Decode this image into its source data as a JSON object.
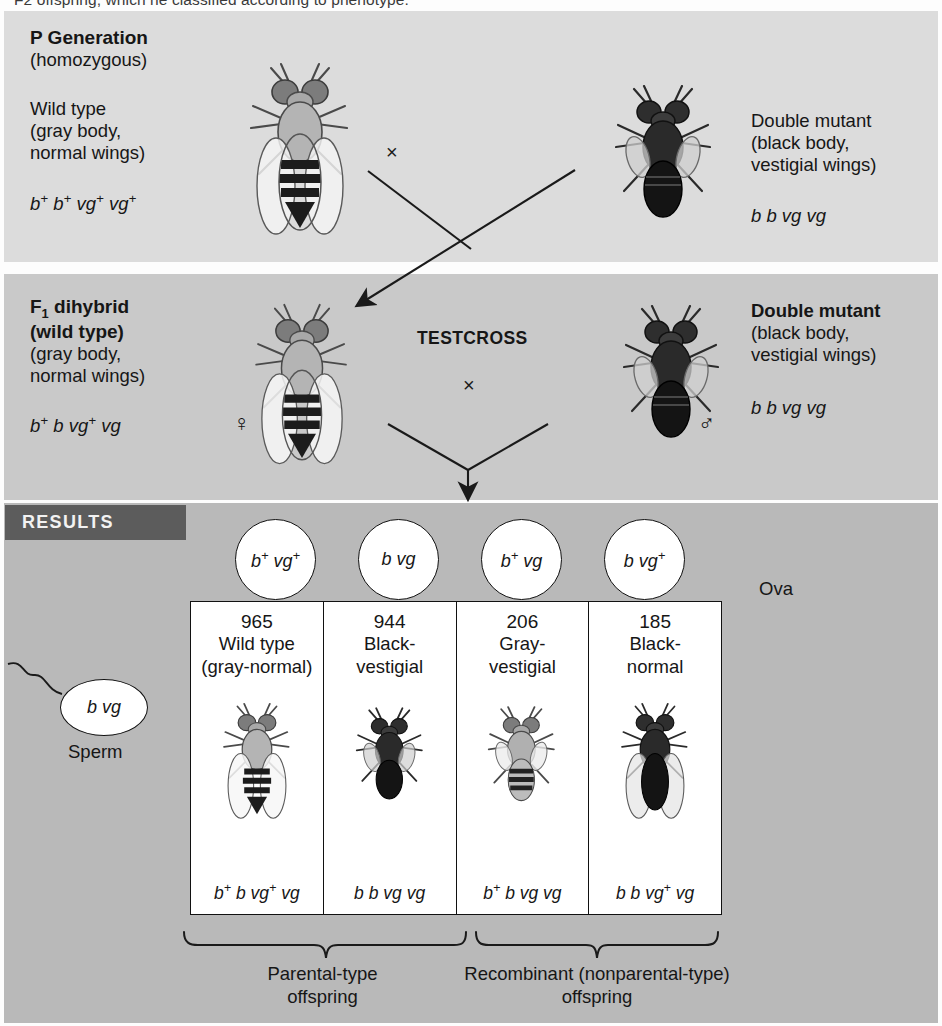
{
  "caption": {
    "top_cutoff_line": "F2 offspring, which he classified according to phenotype."
  },
  "p_generation": {
    "title": "P Generation",
    "subtitle": "(homozygous)",
    "left": {
      "name": "Wild type",
      "desc_line1": "(gray body,",
      "desc_line2": "normal wings)",
      "genotype": "b+ b+ vg+ vg+",
      "fly_icon": "fly-gray-normal-wings"
    },
    "right": {
      "name": "Double mutant",
      "desc_line1": "(black body,",
      "desc_line2": "vestigial wings)",
      "genotype": "b b vg vg",
      "fly_icon": "fly-black-vestigial-wings"
    },
    "cross_symbol": "×"
  },
  "f1_generation": {
    "left": {
      "title_line1": "F1 dihybrid",
      "title_line2": "(wild type)",
      "desc_line1": "(gray body,",
      "desc_line2": "normal wings)",
      "genotype": "b+ b vg+ vg",
      "sex_symbol": "♀",
      "fly_icon": "fly-gray-normal-wings"
    },
    "right": {
      "title": "Double mutant",
      "desc_line1": "(black body,",
      "desc_line2": "vestigial wings)",
      "genotype": "b b vg vg",
      "sex_symbol": "♂",
      "fly_icon": "fly-black-vestigial-wings"
    },
    "testcross_label": "TESTCROSS",
    "cross_symbol": "×"
  },
  "results": {
    "banner": "RESULTS",
    "ova_label": "Ova",
    "ova": [
      {
        "genotype": "b+ vg+"
      },
      {
        "genotype": "b vg"
      },
      {
        "genotype": "b+ vg"
      },
      {
        "genotype": "b vg+"
      }
    ],
    "sperm": {
      "genotype": "b vg",
      "label": "Sperm"
    },
    "offspring": [
      {
        "count": "965",
        "name_line1": "Wild type",
        "name_line2": "(gray-normal)",
        "genotype": "b+ b vg+ vg",
        "fly_icon": "fly-gray-normal-wings"
      },
      {
        "count": "944",
        "name_line1": "Black-",
        "name_line2": "vestigial",
        "genotype": "b b vg vg",
        "fly_icon": "fly-black-vestigial-wings"
      },
      {
        "count": "206",
        "name_line1": "Gray-",
        "name_line2": "vestigial",
        "genotype": "b+ b vg vg",
        "fly_icon": "fly-gray-vestigial-wings"
      },
      {
        "count": "185",
        "name_line1": "Black-",
        "name_line2": "normal",
        "genotype": "b b vg+ vg",
        "fly_icon": "fly-black-normal-wings"
      }
    ],
    "groups": [
      {
        "line1": "Parental-type",
        "line2": "offspring"
      },
      {
        "line1": "Recombinant (nonparental-type)",
        "line2": "offspring"
      }
    ]
  },
  "colors": {
    "panel_p_bg": "#dcdcdc",
    "panel_f1_bg": "#c9c9c9",
    "panel_results_bg": "#b9b9b9",
    "banner_bg": "#5c5c5c",
    "banner_text": "#f2f2f2",
    "table_bg": "#ffffff",
    "ink": "#161616"
  }
}
